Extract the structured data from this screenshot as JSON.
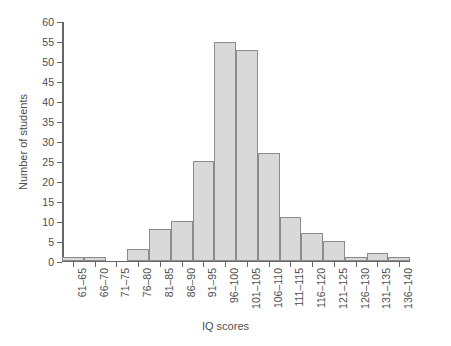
{
  "chart_data": {
    "type": "bar",
    "title": "",
    "xlabel": "IQ scores",
    "ylabel": "Number of students",
    "categories": [
      "61–65",
      "66–70",
      "71–75",
      "76–80",
      "81–85",
      "86–90",
      "91–95",
      "96–100",
      "101–105",
      "106–110",
      "111–115",
      "116–120",
      "121–125",
      "126–130",
      "131–135",
      "136–140"
    ],
    "values": [
      1,
      1,
      0,
      3,
      8,
      10,
      25,
      55,
      53,
      27,
      11,
      7,
      5,
      1,
      2,
      1
    ],
    "ylim": [
      0,
      60
    ],
    "ytick_step": 5,
    "yticks": [
      0,
      5,
      10,
      15,
      20,
      25,
      30,
      35,
      40,
      45,
      50,
      55,
      60
    ],
    "ytick_labels": [
      "0",
      "5",
      "10",
      "15",
      "20",
      "25",
      "30",
      "35",
      "40",
      "45",
      "50",
      "55",
      "60"
    ],
    "grid": false,
    "legend": null,
    "legend_position": "none",
    "bar_fill": "#d9d9d9",
    "bar_stroke": "#8c8c8c",
    "axis_color": "#666666",
    "text_color": "#4d4d4d",
    "background": "#ffffff",
    "xtick_rotation": -90
  }
}
